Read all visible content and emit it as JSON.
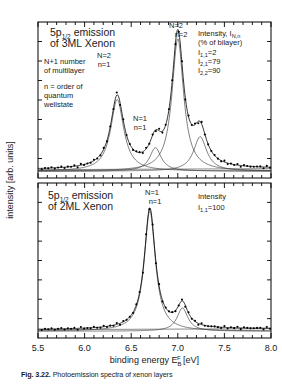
{
  "figure": {
    "caption_label": "Fig. 3.22.",
    "caption_text": "Photoemission spectra of xenon layers"
  },
  "axes": {
    "xlabel_main": "binding energy E",
    "xlabel_sub": "B",
    "xlabel_sup": "F",
    "xlabel_unit": "[eV]",
    "ylabel": "intensity [arb. units]",
    "xticks": [
      "5.5",
      "6.0",
      "6.5",
      "7.0",
      "7.5",
      "8.0"
    ],
    "xlim": [
      5.5,
      8.0
    ],
    "xminor_step": 0.1
  },
  "panel_top": {
    "title_line1_a": "5p",
    "title_line1_sub": "1/2",
    "title_line1_b": " emission",
    "title_line2": "of 3ML Xenon",
    "note1_line1": "N+1 number",
    "note1_line2": "of multilayer",
    "note2_line1": "n = order of",
    "note2_line2": "quantum",
    "note2_line3": "wellstate",
    "intensity_header_a": "Intensity, I",
    "intensity_header_sub": "N,n",
    "intensity_header_b": "(% of bilayer)",
    "intensity_rows": [
      {
        "symbol": "I",
        "sub": "1,1",
        "value": "=2"
      },
      {
        "symbol": "I",
        "sub": "2,1",
        "value": "=79"
      },
      {
        "symbol": "I",
        "sub": "2,2",
        "value": "=90"
      }
    ],
    "peak_labels": [
      {
        "l1": "N=2",
        "l2": "n=1"
      },
      {
        "l1": "N=1",
        "l2": "n=1"
      },
      {
        "l1": "N=2",
        "l2": "n=2"
      }
    ]
  },
  "panel_bottom": {
    "title_line1_a": "5p",
    "title_line1_sub": "1/2",
    "title_line1_b": " emission",
    "title_line2": "of 2ML Xenon",
    "intensity_header": "Intensity",
    "intensity_rows": [
      {
        "symbol": "I",
        "sub": "1,1",
        "value": "=100"
      }
    ],
    "peak_labels": [
      {
        "l1": "N=1",
        "l2": "n=1"
      }
    ]
  },
  "chart_data": {
    "type": "line",
    "xlabel": "binding energy E_B^F [eV]",
    "ylabel": "intensity [arb. units]",
    "xlim": [
      5.5,
      8.0
    ],
    "grid": false,
    "legend": "none",
    "panels": [
      {
        "name": "3ML Xenon",
        "components": [
          {
            "label": "N=2, n=1",
            "center": 6.35,
            "amplitude": 0.52,
            "width": 0.085
          },
          {
            "label": "N=1, n=1",
            "center": 6.76,
            "amplitude": 0.17,
            "width": 0.075
          },
          {
            "label": "N=2, n=2",
            "center": 7.0,
            "amplitude": 0.96,
            "width": 0.075
          },
          {
            "label": "shoulder",
            "center": 7.24,
            "amplitude": 0.25,
            "width": 0.085
          }
        ],
        "baseline": 0.02,
        "data_markers": true
      },
      {
        "name": "2ML Xenon",
        "components": [
          {
            "label": "N=1, n=1",
            "center": 6.7,
            "amplitude": 0.88,
            "width": 0.072
          },
          {
            "label": "shoulder",
            "center": 7.05,
            "amplitude": 0.17,
            "width": 0.07
          }
        ],
        "baseline": 0.02,
        "data_markers": true
      }
    ]
  }
}
